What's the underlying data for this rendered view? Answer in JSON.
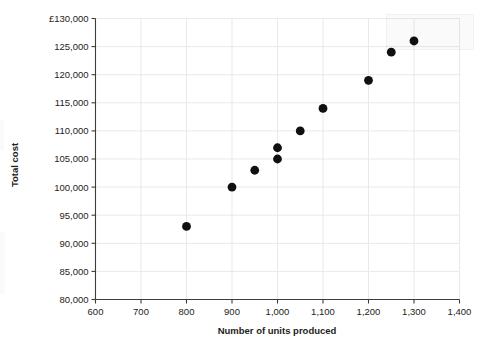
{
  "chart_data": {
    "type": "scatter",
    "title": "",
    "xlabel": "Number of units produced",
    "ylabel": "Total cost",
    "currency_symbol": "£",
    "xlim": [
      600,
      1400
    ],
    "ylim": [
      80000,
      130000
    ],
    "grid": true,
    "legend": "none",
    "x_ticks": [
      600,
      700,
      800,
      900,
      1000,
      1100,
      1200,
      1300,
      1400
    ],
    "x_tick_labels": [
      "600",
      "700",
      "800",
      "900",
      "1,000",
      "1,100",
      "1,200",
      "1,300",
      "1,400"
    ],
    "y_ticks": [
      80000,
      85000,
      90000,
      95000,
      100000,
      105000,
      110000,
      115000,
      120000,
      125000,
      130000
    ],
    "y_tick_labels": [
      "80,000",
      "85,000",
      "90,000",
      "95,000",
      "100,000",
      "105,000",
      "110,000",
      "115,000",
      "120,000",
      "125,000",
      "£130,000"
    ],
    "series": [
      {
        "name": "Total cost observations",
        "marker": "filled-circle",
        "color": "#12100e",
        "points": [
          {
            "x": 800,
            "y": 93000
          },
          {
            "x": 900,
            "y": 100000
          },
          {
            "x": 950,
            "y": 103000
          },
          {
            "x": 1000,
            "y": 105000
          },
          {
            "x": 1000,
            "y": 107000
          },
          {
            "x": 1050,
            "y": 110000
          },
          {
            "x": 1100,
            "y": 114000
          },
          {
            "x": 1200,
            "y": 119000
          },
          {
            "x": 1250,
            "y": 124000
          },
          {
            "x": 1300,
            "y": 126000
          }
        ]
      }
    ]
  },
  "colors": {
    "marker": "#12100e",
    "grid": "#e9e9e9",
    "axis": "#3c3c3b",
    "text": "#1d1d1b",
    "background": "#ffffff"
  }
}
